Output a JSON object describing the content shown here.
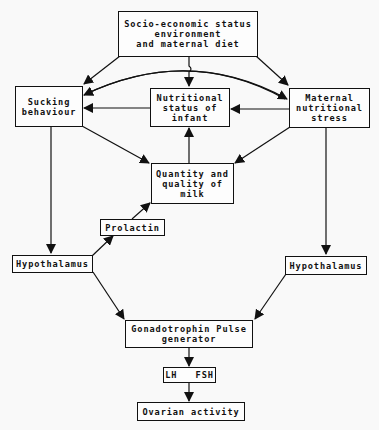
{
  "diagram": {
    "type": "flowchart",
    "colors": {
      "background": "#f9f9f9",
      "stroke": "#111111"
    },
    "nodes": {
      "socio": {
        "lines": [
          "Socio-economic status",
          "environment",
          "and maternal diet"
        ]
      },
      "sucking": {
        "lines": [
          "Sucking",
          "behaviour"
        ]
      },
      "nutritional": {
        "lines": [
          "Nutritional",
          "status of",
          "infant"
        ]
      },
      "maternal": {
        "lines": [
          "Maternal",
          "nutritional",
          "stress"
        ]
      },
      "milk": {
        "lines": [
          "Quantity and",
          "quality of",
          "milk"
        ]
      },
      "prolactin": {
        "lines": [
          "Prolactin"
        ]
      },
      "hypo_left": {
        "lines": [
          "Hypothalamus"
        ]
      },
      "hypo_right": {
        "lines": [
          "Hypothalamus"
        ]
      },
      "gonado": {
        "lines": [
          "Gonadotrophin Pulse",
          "generator"
        ]
      },
      "lhfsh": {
        "lines": [
          "LH   FSH"
        ]
      },
      "ovarian": {
        "lines": [
          "Ovarian activity"
        ]
      }
    },
    "edges": [
      {
        "from": "socio",
        "to": "sucking"
      },
      {
        "from": "socio",
        "to": "nutritional"
      },
      {
        "from": "socio",
        "to": "maternal"
      },
      {
        "from": "maternal",
        "to": "sucking",
        "style": "curved"
      },
      {
        "from": "sucking",
        "to": "maternal",
        "style": "curved"
      },
      {
        "from": "nutritional",
        "to": "sucking"
      },
      {
        "from": "maternal",
        "to": "nutritional"
      },
      {
        "from": "sucking",
        "to": "milk"
      },
      {
        "from": "maternal",
        "to": "milk"
      },
      {
        "from": "milk",
        "to": "nutritional"
      },
      {
        "from": "sucking",
        "to": "hypo_left"
      },
      {
        "from": "hypo_left",
        "to": "prolactin"
      },
      {
        "from": "prolactin",
        "to": "milk"
      },
      {
        "from": "maternal",
        "to": "hypo_right"
      },
      {
        "from": "hypo_left",
        "to": "gonado"
      },
      {
        "from": "hypo_right",
        "to": "gonado"
      },
      {
        "from": "gonado",
        "to": "lhfsh"
      },
      {
        "from": "lhfsh",
        "to": "ovarian"
      }
    ]
  }
}
